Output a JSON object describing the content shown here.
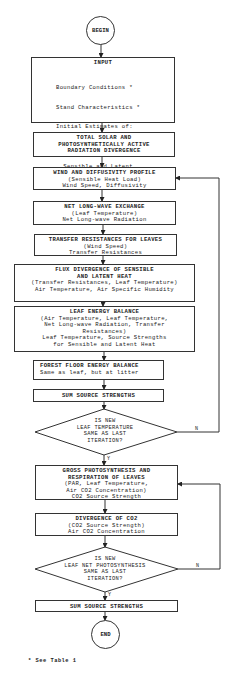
{
  "start": {
    "label": "BEGIN"
  },
  "end": {
    "label": "END"
  },
  "input": {
    "title": "INPUT",
    "lines": [
      "Boundary Conditions *",
      "Stand Characteristics *",
      "Initial Estimates of:",
      "  Leaf Temperature",
      "  Sensible and Latent",
      "    Heat Loads",
      "  Air CO2 Profile"
    ]
  },
  "steps": [
    {
      "title": [
        "TOTAL SOLAR AND",
        "PHOTOSYNTHETICALLY ACTIVE",
        "RADIATION DIVERGENCE"
      ],
      "lines": []
    },
    {
      "title": [
        "WIND AND DIFFUSIVITY PROFILE"
      ],
      "lines": [
        "(Sensible Heat Load)",
        "Wind Speed, Diffusivity"
      ]
    },
    {
      "title": [
        "NET LONG-WAVE EXCHANGE"
      ],
      "lines": [
        "(Leaf Temperature)",
        "Net Long-wave Radiation"
      ]
    },
    {
      "title": [
        "TRANSFER RESISTANCES FOR LEAVES"
      ],
      "lines": [
        "(Wind Speed)",
        "Transfer Resistances"
      ]
    },
    {
      "title": [
        "FLUX DIVERGENCE OF SENSIBLE",
        "AND LATENT HEAT"
      ],
      "lines": [
        "(Transfer Resistances, Leaf Temperature)",
        "Air Temperature, Air Specific Humidity"
      ]
    },
    {
      "title": [
        "LEAF ENERGY BALANCE"
      ],
      "lines": [
        "(Air Temperature, Leaf Temperature,",
        "Net Long-wave Radiation, Transfer",
        "Resistances)",
        "Leaf Temperature, Source Strengths",
        "for Sensible and Latent Heat"
      ]
    },
    {
      "title": [
        "FOREST FLOOR ENERGY BALANCE"
      ],
      "lines": [
        "Same as leaf, but at litter"
      ]
    },
    {
      "title": [
        "SUM SOURCE STRENGTHS"
      ],
      "lines": []
    },
    {
      "title": [
        "GROSS PHOTOSYNTHESIS AND",
        "RESPIRATION OF LEAVES"
      ],
      "lines": [
        "(PAR, Leaf Temperature,",
        "Air CO2 Concentration)",
        "CO2 Source Strength"
      ]
    },
    {
      "title": [
        "DIVERGENCE OF CO2"
      ],
      "lines": [
        "(CO2 Source Strength)",
        "Air CO2 Concentration"
      ]
    },
    {
      "title": [
        "SUM SOURCE STRENGTHS"
      ],
      "lines": []
    }
  ],
  "decisions": [
    {
      "lines": [
        "IS NEW",
        "LEAF TEMPERATURE",
        "SAME AS LAST",
        "ITERATION?"
      ],
      "yes": "Y",
      "no": "N"
    },
    {
      "lines": [
        "IS NEW",
        "LEAF NET PHOTOSYNTHESIS",
        "SAME AS LAST",
        "ITERATION?"
      ],
      "yes": "Y",
      "no": "N"
    }
  ],
  "footnote": "* See Table 1"
}
